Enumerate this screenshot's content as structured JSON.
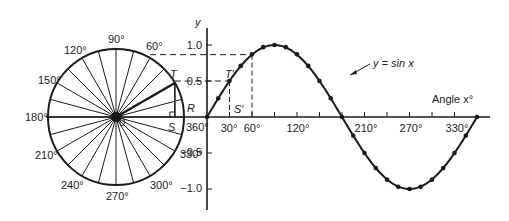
{
  "circle": {
    "angle_labels": [
      {
        "text": "90°",
        "x": 108,
        "y": 43
      },
      {
        "text": "60°",
        "x": 146,
        "y": 50
      },
      {
        "text": "120°",
        "x": 64,
        "y": 54
      },
      {
        "text": "150°",
        "x": 38,
        "y": 84
      },
      {
        "text": "180°",
        "x": 25,
        "y": 121
      },
      {
        "text": "210°",
        "x": 35,
        "y": 159
      },
      {
        "text": "240°",
        "x": 61,
        "y": 189
      },
      {
        "text": "270°",
        "x": 106,
        "y": 200
      },
      {
        "text": "300°",
        "x": 150,
        "y": 189
      },
      {
        "text": "330°",
        "x": 180,
        "y": 158
      },
      {
        "text": "360°",
        "x": 186,
        "y": 131
      }
    ],
    "point_labels": {
      "T": "T",
      "R": "R",
      "S": "S",
      "O": "0"
    }
  },
  "graph": {
    "y_axis_label": "y",
    "x_axis_label": "Angle x°",
    "curve_label": "y = sin x",
    "y_ticks": [
      {
        "text": "1.0",
        "y": 45
      },
      {
        "text": "0.5",
        "y": 81
      },
      {
        "text": "−0.5",
        "y": 152
      },
      {
        "text": "−1.0",
        "y": 188
      }
    ],
    "x_ticks": [
      {
        "text": "30°",
        "x": 229
      },
      {
        "text": "60°",
        "x": 252
      },
      {
        "text": "120°",
        "x": 298
      },
      {
        "text": "210°",
        "x": 366
      },
      {
        "text": "270°",
        "x": 411
      },
      {
        "text": "330°",
        "x": 457
      }
    ],
    "point_labels": {
      "T_prime": "T′",
      "S_prime": "S′"
    }
  },
  "chart_data": {
    "type": "line",
    "title": "y = sin x",
    "xlabel": "Angle x°",
    "ylabel": "y",
    "x": [
      0,
      15,
      30,
      45,
      60,
      75,
      90,
      105,
      120,
      135,
      150,
      165,
      180,
      195,
      210,
      225,
      240,
      255,
      270,
      285,
      300,
      315,
      330,
      345,
      360
    ],
    "series": [
      {
        "name": "y = sin x",
        "values": [
          0,
          0.26,
          0.5,
          0.71,
          0.87,
          0.97,
          1.0,
          0.97,
          0.87,
          0.71,
          0.5,
          0.26,
          0,
          -0.26,
          -0.5,
          -0.71,
          -0.87,
          -0.97,
          -1.0,
          -0.97,
          -0.87,
          -0.71,
          -0.5,
          -0.26,
          0
        ]
      }
    ],
    "xlim": [
      0,
      360
    ],
    "ylim": [
      -1.0,
      1.0
    ],
    "annotations": [
      "T",
      "R",
      "S",
      "T′",
      "S′",
      "dashed projection at 0.5 (30°)",
      "dashed projection at 0.87 (60°)"
    ]
  }
}
